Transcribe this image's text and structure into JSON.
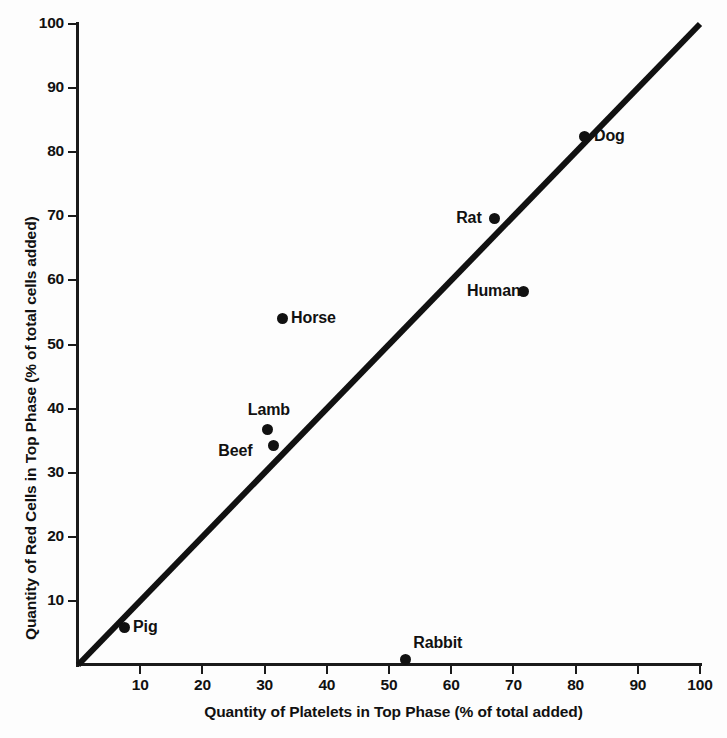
{
  "chart_data": {
    "type": "scatter",
    "title": "",
    "xlabel": "Quantity of Platelets in Top Phase (% of total added)",
    "ylabel": "Quantity of Red Cells in Top Phase (% of total cells added)",
    "xlim": [
      0,
      100
    ],
    "ylim": [
      0,
      100
    ],
    "xticks": [
      10,
      20,
      30,
      40,
      50,
      60,
      70,
      80,
      90,
      100
    ],
    "yticks": [
      10,
      20,
      30,
      40,
      50,
      60,
      70,
      80,
      90,
      100
    ],
    "xtick_labels": [
      "10",
      "20",
      "30",
      "40",
      "50",
      "60",
      "70",
      "80",
      "90",
      "100"
    ],
    "ytick_labels": [
      "10",
      "20",
      "30",
      "40",
      "50",
      "60",
      "70",
      "80",
      "90",
      "100"
    ],
    "grid": false,
    "legend": "none",
    "annotations": [
      {
        "label": "Pig",
        "x": 7.4,
        "y": 5.8,
        "label_side": "right"
      },
      {
        "label": "Rabbit",
        "x": 52.6,
        "y": 0.8,
        "label_side": "right-above"
      },
      {
        "label": "Beef",
        "x": 31.4,
        "y": 34.2,
        "label_side": "left"
      },
      {
        "label": "Lamb",
        "x": 30.5,
        "y": 36.7,
        "label_side": "above-left"
      },
      {
        "label": "Horse",
        "x": 32.8,
        "y": 54.0,
        "label_side": "right"
      },
      {
        "label": "Human",
        "x": 71.7,
        "y": 58.2,
        "label_side": "left"
      },
      {
        "label": "Rat",
        "x": 67.0,
        "y": 69.6,
        "label_side": "left"
      },
      {
        "label": "Dog",
        "x": 81.5,
        "y": 82.4,
        "label_side": "right"
      }
    ],
    "reference_line": {
      "name": "identity-line",
      "from": [
        0,
        0
      ],
      "to": [
        100,
        100
      ],
      "color": "#111111",
      "width_px": 6
    },
    "series": [
      {
        "name": "species",
        "marker": "filled-circle",
        "color": "#111111",
        "points": [
          {
            "label": "Pig",
            "x": 7.4,
            "y": 5.8
          },
          {
            "label": "Rabbit",
            "x": 52.6,
            "y": 0.8
          },
          {
            "label": "Beef",
            "x": 31.4,
            "y": 34.2
          },
          {
            "label": "Lamb",
            "x": 30.5,
            "y": 36.7
          },
          {
            "label": "Horse",
            "x": 32.8,
            "y": 54.0
          },
          {
            "label": "Human",
            "x": 71.7,
            "y": 58.2
          },
          {
            "label": "Rat",
            "x": 67.0,
            "y": 69.6
          },
          {
            "label": "Dog",
            "x": 81.5,
            "y": 82.4
          }
        ]
      }
    ]
  },
  "axes": {
    "x": {
      "title": "Quantity of Platelets in Top Phase (% of total added)",
      "ticks": [
        {
          "value": 10,
          "label": "10"
        },
        {
          "value": 20,
          "label": "20"
        },
        {
          "value": 30,
          "label": "30"
        },
        {
          "value": 40,
          "label": "40"
        },
        {
          "value": 50,
          "label": "50"
        },
        {
          "value": 60,
          "label": "60"
        },
        {
          "value": 70,
          "label": "70"
        },
        {
          "value": 80,
          "label": "80"
        },
        {
          "value": 90,
          "label": "90"
        },
        {
          "value": 100,
          "label": "100"
        }
      ]
    },
    "y": {
      "title": "Quantity of Red Cells in Top Phase (% of total cells added)",
      "ticks": [
        {
          "value": 10,
          "label": "10"
        },
        {
          "value": 20,
          "label": "20"
        },
        {
          "value": 30,
          "label": "30"
        },
        {
          "value": 40,
          "label": "40"
        },
        {
          "value": 50,
          "label": "50"
        },
        {
          "value": 60,
          "label": "60"
        },
        {
          "value": 70,
          "label": "70"
        },
        {
          "value": 80,
          "label": "80"
        },
        {
          "value": 90,
          "label": "90"
        },
        {
          "value": 100,
          "label": "100"
        }
      ]
    }
  },
  "colors": {
    "marker": "#111111",
    "axis": "#1a1a1a",
    "line": "#111111",
    "background": "#fdfdfd"
  }
}
